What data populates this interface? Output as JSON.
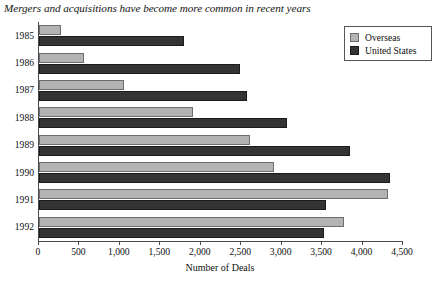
{
  "chart_data": {
    "type": "bar",
    "orientation": "horizontal",
    "title": "Mergers and acquisitions have become more common in recent years",
    "xlabel": "Number of Deals",
    "ylabel": "",
    "categories": [
      "1985",
      "1986",
      "1987",
      "1988",
      "1989",
      "1990",
      "1991",
      "1992"
    ],
    "series": [
      {
        "name": "Overseas",
        "color": "#b3b3b3",
        "values": [
          270,
          555,
          1050,
          1900,
          2610,
          2900,
          4320,
          3770
        ]
      },
      {
        "name": "United States",
        "color": "#343434",
        "values": [
          1790,
          2490,
          2570,
          3070,
          3840,
          4340,
          3545,
          3520
        ]
      }
    ],
    "xlim": [
      0,
      4500
    ],
    "xticks": [
      0,
      500,
      1000,
      1500,
      2000,
      2500,
      3000,
      3500,
      4000,
      4500
    ],
    "xticklabels": [
      "0",
      "500",
      "1,000",
      "1,500",
      "2,000",
      "2,500",
      "3,000",
      "3,500",
      "4,000",
      "4,500"
    ],
    "grid": false,
    "legend_position": "top-right"
  },
  "legend": {
    "items": [
      {
        "label": "Overseas",
        "swatch": "light-gray-swatch"
      },
      {
        "label": "United States",
        "swatch": "dark-gray-swatch"
      }
    ]
  }
}
